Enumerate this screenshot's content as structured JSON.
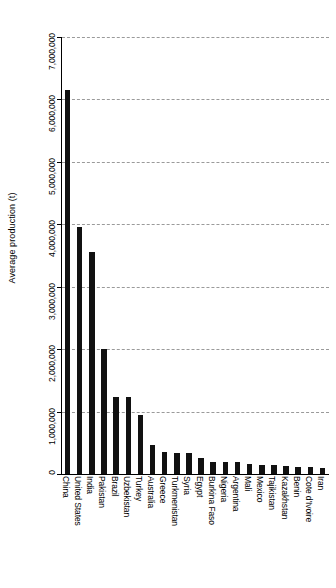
{
  "chart_data": {
    "type": "bar",
    "title": "",
    "subtitle": "",
    "xlabel": "",
    "ylabel": "Average production (t)",
    "ylim": [
      0,
      7000000
    ],
    "ytick_values": [
      0,
      1000000,
      2000000,
      3000000,
      4000000,
      5000000,
      6000000,
      7000000
    ],
    "ytick_labels": [
      "0",
      "1,000,000",
      "2,000,000",
      "3,000,000",
      "4,000,000",
      "5,000,000",
      "6,000,000",
      "7,000,000"
    ],
    "grid": true,
    "grid_style": "dashed",
    "grid_color": "#9a9a9a",
    "bar_color": "#111111",
    "legend": null,
    "orientation": "vertical",
    "categories": [
      "China",
      "United States",
      "India",
      "Pakistan",
      "Brazil",
      "Uzbekistan",
      "Turkey",
      "Australia",
      "Greece",
      "Turkmenistan",
      "Syria",
      "Egypt",
      "Burkina Faso",
      "Nigeria",
      "Argentina",
      "Mali",
      "Mexico",
      "Tajikistan",
      "Kazakhstan",
      "Benin",
      "Cote d'Ivoire",
      "Iran"
    ],
    "values": [
      6150000,
      3950000,
      3550000,
      2000000,
      1230000,
      1230000,
      940000,
      470000,
      360000,
      330000,
      330000,
      250000,
      200000,
      190000,
      185000,
      160000,
      150000,
      140000,
      135000,
      120000,
      110000,
      100000
    ]
  }
}
